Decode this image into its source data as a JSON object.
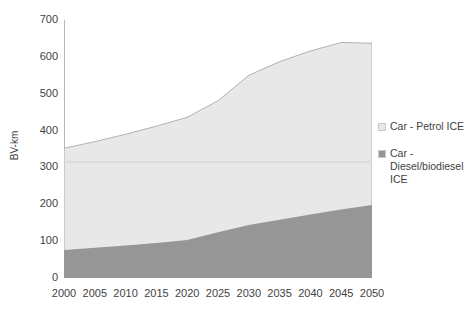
{
  "chart_data": {
    "type": "area",
    "stacked": true,
    "title": "",
    "xlabel": "",
    "ylabel": "BV-km",
    "x": [
      2000,
      2005,
      2010,
      2015,
      2020,
      2025,
      2030,
      2035,
      2040,
      2045,
      2050
    ],
    "xlim": [
      2000,
      2050
    ],
    "ylim": [
      0,
      700
    ],
    "yticks": [
      0,
      100,
      200,
      300,
      400,
      500,
      600,
      700
    ],
    "xticks": [
      "2000",
      "2005",
      "2010",
      "2015",
      "2020",
      "2025",
      "2030",
      "2035",
      "2040",
      "2045",
      "2050"
    ],
    "grid": false,
    "legend_position": "right",
    "series": [
      {
        "name": "Car - Diesel/biodiesel ICE",
        "color": "#969696",
        "values": [
          76,
          82,
          88,
          95,
          103,
          124,
          144,
          158,
          172,
          186,
          198
        ]
      },
      {
        "name": "Car - Petrol ICE",
        "color": "#E8E8E8",
        "values": [
          276,
          288,
          302,
          317,
          333,
          357,
          406,
          429,
          444,
          453,
          439
        ]
      }
    ],
    "totals": [
      352,
      370,
      390,
      412,
      436,
      481,
      550,
      587,
      616,
      639,
      637
    ]
  },
  "axes": {
    "y_title": "BV-km",
    "y_tick_labels": [
      "700",
      "600",
      "500",
      "400",
      "300",
      "200",
      "100",
      "0"
    ],
    "x_tick_labels": [
      "2000",
      "2005",
      "2010",
      "2015",
      "2020",
      "2025",
      "2030",
      "2035",
      "2040",
      "2045",
      "2050"
    ]
  },
  "legend": {
    "items": [
      {
        "label": "Car - Petrol ICE",
        "color": "#E8E8E8",
        "swatch": "light-gray-square"
      },
      {
        "label": "Car - Diesel/biodiesel ICE",
        "color": "#969696",
        "swatch": "dark-gray-square"
      }
    ]
  },
  "colors": {
    "petrol": "#E8E8E8",
    "diesel": "#969696",
    "axis": "#9a9a9a",
    "text": "#3f3f3f",
    "background": "#ffffff"
  }
}
